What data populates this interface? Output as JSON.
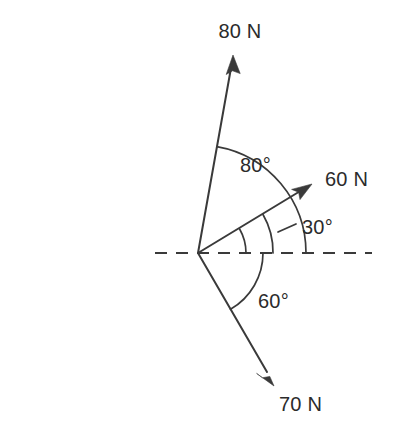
{
  "diagram": {
    "type": "free-body-force-diagram",
    "origin": {
      "x": 198,
      "y": 253
    },
    "colors": {
      "line": "#3a3a3a",
      "text": "#2b2b2b",
      "background": "#ffffff"
    },
    "reference_axis": {
      "name": "horizontal-dashed-axis",
      "style": "dashed",
      "x_start": 155,
      "x_end": 372,
      "y": 253
    },
    "forces": [
      {
        "label": "80 N",
        "magnitude": 80,
        "unit": "N",
        "angle_from_horizontal_deg": 80,
        "direction": "up-right",
        "tip": {
          "x": 233,
          "y": 58
        },
        "label_position": {
          "x": 240,
          "y": 38
        }
      },
      {
        "label": "60 N",
        "magnitude": 60,
        "unit": "N",
        "angle_from_horizontal_deg": 30,
        "direction": "up-right",
        "tip": {
          "x": 310,
          "y": 185
        },
        "label_position": {
          "x": 325,
          "y": 186
        }
      },
      {
        "label": "70 N",
        "magnitude": 70,
        "unit": "N",
        "angle_from_horizontal_deg": -60,
        "direction": "down-right",
        "tip": {
          "x": 272,
          "y": 383
        },
        "label_position": {
          "x": 279,
          "y": 411
        }
      }
    ],
    "angles": [
      {
        "label": "80°",
        "value": 80,
        "unit": "degrees",
        "between": [
          "80 N",
          "horizontal-dashed-axis"
        ],
        "arc_radius": 108,
        "label_position": {
          "x": 240,
          "y": 172
        }
      },
      {
        "label": "30°",
        "value": 30,
        "unit": "degrees",
        "between": [
          "60 N",
          "horizontal-dashed-axis"
        ],
        "arc_radius": 48,
        "outer_arc_radius": 75,
        "label_position": {
          "x": 302,
          "y": 234
        }
      },
      {
        "label": "60°",
        "value": 60,
        "unit": "degrees",
        "between": [
          "horizontal-dashed-axis",
          "70 N"
        ],
        "arc_radius": 65,
        "label_position": {
          "x": 258,
          "y": 308
        }
      }
    ]
  }
}
